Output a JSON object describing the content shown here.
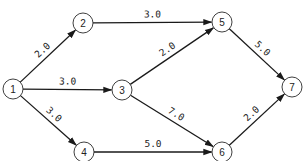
{
  "diagram": {
    "type": "directed-weighted-graph",
    "colors": {
      "stroke": "#1a1a1a",
      "node_fill": "#ffffff",
      "text": "#222222"
    },
    "nodes": [
      {
        "id": "1",
        "label": "1",
        "x": 13,
        "y": 89
      },
      {
        "id": "2",
        "label": "2",
        "x": 83,
        "y": 23
      },
      {
        "id": "3",
        "label": "3",
        "x": 122,
        "y": 90
      },
      {
        "id": "4",
        "label": "4",
        "x": 84,
        "y": 152
      },
      {
        "id": "5",
        "label": "5",
        "x": 222,
        "y": 22
      },
      {
        "id": "6",
        "label": "6",
        "x": 222,
        "y": 152
      },
      {
        "id": "7",
        "label": "7",
        "x": 292,
        "y": 87
      }
    ],
    "edges": [
      {
        "from": "1",
        "to": "2",
        "weight": "2.0"
      },
      {
        "from": "1",
        "to": "3",
        "weight": "3.0"
      },
      {
        "from": "1",
        "to": "4",
        "weight": "3.0"
      },
      {
        "from": "2",
        "to": "5",
        "weight": "3.0"
      },
      {
        "from": "3",
        "to": "5",
        "weight": "2.0"
      },
      {
        "from": "3",
        "to": "6",
        "weight": "7.0"
      },
      {
        "from": "4",
        "to": "6",
        "weight": "5.0"
      },
      {
        "from": "5",
        "to": "7",
        "weight": "5.0"
      },
      {
        "from": "6",
        "to": "7",
        "weight": "2.0"
      }
    ]
  }
}
